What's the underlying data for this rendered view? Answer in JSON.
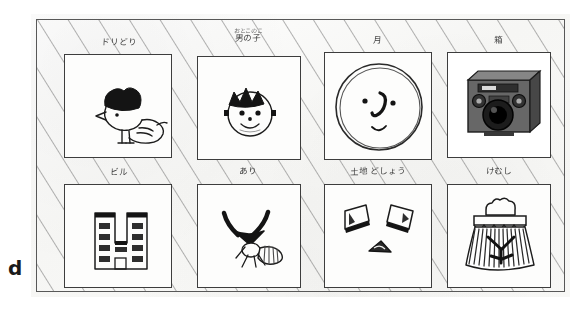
{
  "figure": {
    "panel_letter": "d",
    "medium": "scanned hand-drawn board, pencil on paper with diagonal hatch shading",
    "board": {
      "border_color": "#4a4a4a",
      "paper_color": "#fbfbfa",
      "hatch_color": "#6b6b6b",
      "hatch_direction": "diagonal-down-left"
    },
    "grid": {
      "rows": 2,
      "columns": 4,
      "total_panels": 8
    }
  },
  "panels": [
    {
      "id": "bird",
      "name": "panel-bird",
      "caption": "ドリどり",
      "caption_secondary": "",
      "subject": "bird-drawing",
      "description": "small chick with dark cap of hair, round body and wing",
      "ink_color": "#1c1c1c",
      "row": 1,
      "column": 1
    },
    {
      "id": "boy",
      "name": "panel-boy",
      "caption": "男の子",
      "caption_secondary": "おとこのこ",
      "subject": "boy-face-drawing",
      "description": "round smiling face with spiky dark hair and ears",
      "ink_color": "#1c1c1c",
      "row": 1,
      "column": 2
    },
    {
      "id": "moon",
      "name": "panel-moon",
      "caption": "月",
      "caption_secondary": "",
      "subject": "moon-face-drawing",
      "description": "large circle with two dot eyes, hooked nose and small smile",
      "ink_color": "#1c1c1c",
      "row": 1,
      "column": 3
    },
    {
      "id": "camera",
      "name": "panel-camera",
      "caption": "箱",
      "caption_secondary": "",
      "subject": "box-camera-photo",
      "description": "grey photograph of a vintage box camera with round lens",
      "ink_color": "#3a3a3a",
      "row": 1,
      "column": 4
    },
    {
      "id": "building",
      "name": "panel-building",
      "caption": "ビル",
      "caption_secondary": "",
      "subject": "building-drawing",
      "description": "U-shaped apartment block with rows of dark windows and a door",
      "ink_color": "#1c1c1c",
      "row": 2,
      "column": 1
    },
    {
      "id": "ant",
      "name": "panel-ant",
      "caption": "あり",
      "caption_secondary": "",
      "subject": "ant-drawing",
      "description": "ant with two bold bent antennae, legs and striped abdomen",
      "ink_color": "#1c1c1c",
      "row": 2,
      "column": 2
    },
    {
      "id": "shapes",
      "name": "panel-shapes",
      "caption": "土地 どしょう",
      "caption_secondary": "",
      "subject": "abstract-shapes-drawing",
      "description": "two tilted quadrilaterals above a small solid triangle",
      "ink_color": "#1c1c1c",
      "row": 2,
      "column": 3
    },
    {
      "id": "tree",
      "name": "panel-tree",
      "caption": "けむし",
      "caption_secondary": "",
      "subject": "tree-drawing",
      "description": "dark fringed tree or mountain shape with scalloped crown on top",
      "ink_color": "#1c1c1c",
      "row": 2,
      "column": 4
    }
  ]
}
